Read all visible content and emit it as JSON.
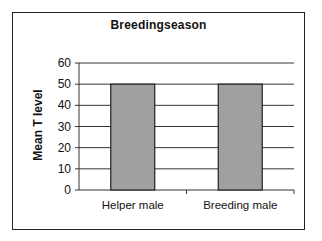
{
  "chart_data": {
    "type": "bar",
    "title": "Breedingseason",
    "xlabel": "",
    "ylabel": "Mean T level",
    "categories": [
      "Helper male",
      "Breeding male"
    ],
    "values": [
      50,
      50
    ],
    "ylim": [
      0,
      60
    ],
    "yticks": [
      0,
      10,
      20,
      30,
      40,
      50,
      60
    ],
    "grid": true,
    "legend": null,
    "bar_color": "#a0a0a0",
    "bar_edge_color": "#222222"
  }
}
